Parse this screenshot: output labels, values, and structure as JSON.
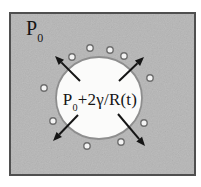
{
  "labels": {
    "ambient_pressure": {
      "base": "P",
      "sub": "0"
    },
    "bubble_pressure": {
      "base": "P",
      "sub": "0",
      "rest": "+2γ/R(t)"
    }
  },
  "colors": {
    "page_bg": "#ffffff",
    "liquid_bg": "#b6b6b6",
    "frame_border": "#4f4f4f",
    "bubble_fill": "#fbfbfa",
    "bubble_stroke": "#8e8e8e",
    "arrow": "#151515",
    "nucleus_fill": "#f4f4f4",
    "nucleus_stroke": "#6e6e6e"
  },
  "frame": {
    "x": 9,
    "y": 12,
    "width": 187,
    "height": 164
  },
  "bubble": {
    "cx": 99,
    "cy": 98,
    "rx": 43,
    "ry": 41
  },
  "nuclei": [
    [
      72,
      57
    ],
    [
      90,
      48
    ],
    [
      110,
      50
    ],
    [
      124,
      56
    ],
    [
      150,
      78
    ],
    [
      144,
      123
    ],
    [
      121,
      142
    ],
    [
      87,
      146
    ],
    [
      53,
      121
    ],
    [
      44,
      88
    ]
  ],
  "nucleus_radius": 3.2,
  "arrows": [
    {
      "name": "top-left",
      "x1": 80,
      "y1": 81,
      "x2": 55,
      "y2": 56
    },
    {
      "name": "top-right",
      "x1": 119,
      "y1": 81,
      "x2": 144,
      "y2": 57
    },
    {
      "name": "bottom-left",
      "x1": 78,
      "y1": 115,
      "x2": 53,
      "y2": 141
    },
    {
      "name": "bottom-right",
      "x1": 118,
      "y1": 114,
      "x2": 145,
      "y2": 146
    }
  ]
}
